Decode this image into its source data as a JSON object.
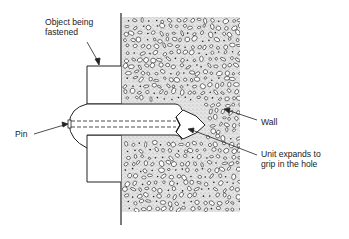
{
  "diagram": {
    "type": "annotated-cross-section",
    "labels": {
      "object": {
        "line1": "Object being",
        "line2": "fastened"
      },
      "pin": "Pin",
      "wall": "Wall",
      "unit": {
        "line1": "Unit expands to",
        "line2": "grip in the hole"
      }
    },
    "components": [
      {
        "id": "object",
        "name": "Object being fastened"
      },
      {
        "id": "pin",
        "name": "Pin"
      },
      {
        "id": "wall",
        "name": "Wall"
      },
      {
        "id": "expansion-unit",
        "name": "Unit expands to grip in the hole"
      }
    ],
    "colors": {
      "ink": "#222222",
      "wall_fill": "#d9d9d9",
      "paper": "#ffffff"
    }
  }
}
